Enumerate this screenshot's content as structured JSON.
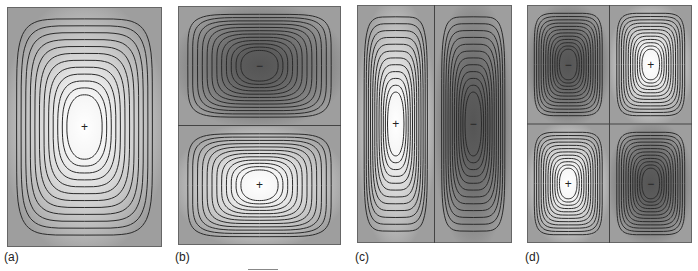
{
  "figure": {
    "colors": {
      "background_gray": "#9e9e9e",
      "positive_peak": "#ffffff",
      "negative_peak": "#555555",
      "contour_line": "#2a2a2a"
    },
    "panels": [
      {
        "id": "a",
        "label": "(a)",
        "mode": [
          1,
          1
        ],
        "cells": [
          {
            "sign": "+"
          }
        ]
      },
      {
        "id": "b",
        "label": "(b)",
        "mode": [
          1,
          2
        ],
        "cells": [
          {
            "sign": "−"
          },
          {
            "sign": "+"
          }
        ]
      },
      {
        "id": "c",
        "label": "(c)",
        "mode": [
          2,
          1
        ],
        "cells": [
          {
            "sign": "+"
          },
          {
            "sign": "−"
          }
        ]
      },
      {
        "id": "d",
        "label": "(d)",
        "mode": [
          2,
          2
        ],
        "cells": [
          {
            "sign": "−"
          },
          {
            "sign": "+"
          },
          {
            "sign": "+"
          },
          {
            "sign": "−"
          }
        ]
      }
    ]
  }
}
